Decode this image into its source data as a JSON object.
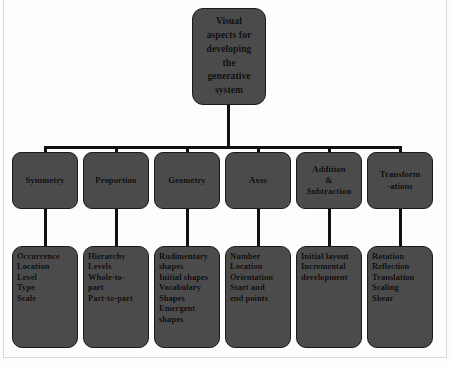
{
  "diagram": {
    "type": "hierarchy-tree",
    "root": {
      "label": "Visual\naspects for\ndeveloping\nthe\ngenerative\nsystem"
    },
    "categories": [
      {
        "label": "Symmetry"
      },
      {
        "label": "Proportion"
      },
      {
        "label": "Geometry"
      },
      {
        "label": "Axes"
      },
      {
        "label": "Addition\n&\nSubtraction"
      },
      {
        "label": "Transform\n-ations"
      }
    ],
    "details": [
      {
        "label": "Occurrence\nLocation\nLevel\nType\nScale"
      },
      {
        "label": "Hierarchy\nLevels\nWhole-to-\npart\nPart-to-part"
      },
      {
        "label": "Rudimentary\nshapes\nInitial shapes\nVocabulary\nShapes\nEmergent\nshapes"
      },
      {
        "label": "Number\nLocation\nOrientation\nStart and\nend points"
      },
      {
        "label": "Initial layout\nIncremental\ndevelopment"
      },
      {
        "label": "Rotation\nReflection\nTranslation\nScaling\nShear"
      }
    ],
    "colors": {
      "node_fill": "#4b4b4b",
      "node_border": "#1a1a1a",
      "text": "#0a0a0a",
      "connector": "#111111",
      "background": "#fdfdfd"
    }
  }
}
